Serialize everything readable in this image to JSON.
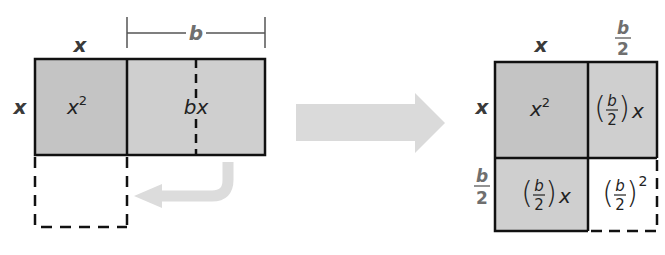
{
  "colors": {
    "shade_dark": "#c4c4c4",
    "shade_light": "#cfcfcf",
    "stroke": "#111111",
    "arrow": "#dcdcdc",
    "dim_label": "#6f6f6f",
    "side_label": "#3a3a3a"
  },
  "left_figure": {
    "top_label_x": "x",
    "side_label_x": "x",
    "dimension_label": "b",
    "cells": [
      {
        "id": "x-squared",
        "label_base": "x",
        "label_exp": "2"
      },
      {
        "id": "bx",
        "label": "bx"
      }
    ],
    "dashed_square_note": ""
  },
  "transform_arrow": {
    "icon": "right-arrow-icon"
  },
  "return_arrow": {
    "icon": "curved-left-arrow-icon"
  },
  "right_figure": {
    "top_label_x": "x",
    "top_label_frac_num": "b",
    "top_label_frac_den": "2",
    "side_label_x": "x",
    "side_label_frac_num": "b",
    "side_label_frac_den": "2",
    "cells": [
      {
        "id": "x-squared",
        "label_base": "x",
        "label_exp": "2"
      },
      {
        "id": "b-half-x-top",
        "frac_num": "b",
        "frac_den": "2",
        "suffix": "x"
      },
      {
        "id": "b-half-x-bottom",
        "frac_num": "b",
        "frac_den": "2",
        "suffix": "x"
      },
      {
        "id": "b-half-squared",
        "frac_num": "b",
        "frac_den": "2",
        "exp": "2"
      }
    ]
  }
}
